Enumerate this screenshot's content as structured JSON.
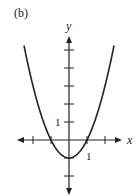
{
  "panel_label": "(b)",
  "chart_data": {
    "type": "line",
    "title": "",
    "function": "y = x^2 - 1",
    "xlabel": "x",
    "ylabel": "y",
    "x_tick_labels": [
      {
        "value": 1,
        "label": "1"
      }
    ],
    "y_tick_labels": [
      {
        "value": 1,
        "label": "1"
      }
    ],
    "x_ticks": [
      -2,
      -1,
      1,
      2
    ],
    "y_ticks": [
      -2,
      -1,
      1,
      2,
      3,
      4,
      5
    ],
    "xlim": [
      -2.5,
      2.5
    ],
    "ylim": [
      -3,
      6
    ],
    "grid": false,
    "legend": null,
    "series": [
      {
        "name": "y = x^2 - 1",
        "x": [
          -2.5,
          -2,
          -1.5,
          -1,
          -0.5,
          0,
          0.5,
          1,
          1.5,
          2,
          2.5
        ],
        "y": [
          5.25,
          3,
          1.25,
          0,
          -0.75,
          -1,
          -0.75,
          0,
          1.25,
          3,
          5.25
        ]
      }
    ],
    "key_points": {
      "x_intercepts": [
        -1,
        1
      ],
      "vertex": [
        0,
        -1
      ]
    }
  },
  "colors": {
    "ink": "#222222",
    "background": "#ffffff"
  }
}
